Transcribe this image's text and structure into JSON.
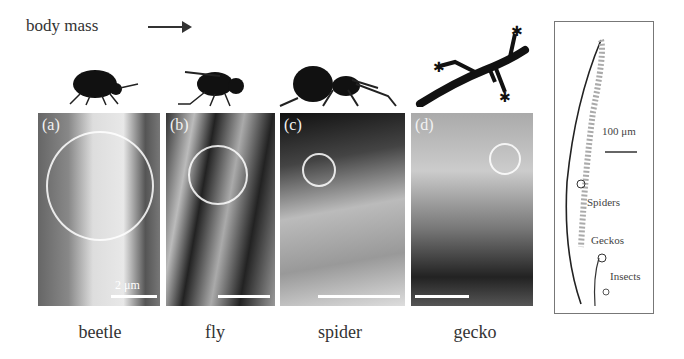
{
  "header": {
    "title": "body mass",
    "arrow": "right-arrow"
  },
  "animals": [
    {
      "name": "beetle",
      "panel_label": "(a)",
      "scale_text": "2 μm"
    },
    {
      "name": "fly",
      "panel_label": "(b)",
      "scale_text": ""
    },
    {
      "name": "spider",
      "panel_label": "(c)",
      "scale_text": ""
    },
    {
      "name": "gecko",
      "panel_label": "(d)",
      "scale_text": ""
    }
  ],
  "inset": {
    "scale_label": "100 μm",
    "labels": [
      "Spiders",
      "Geckos",
      "Insects"
    ]
  }
}
